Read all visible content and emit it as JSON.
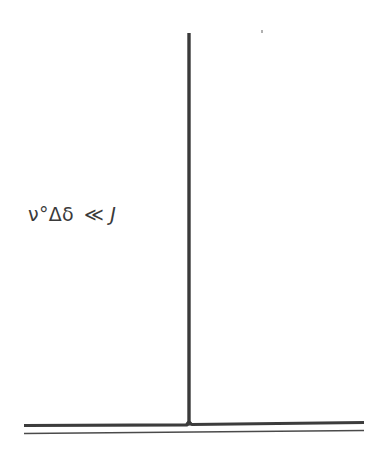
{
  "diagram": {
    "type": "nmr-spectrum",
    "annotation": {
      "left_part": "ν°Δδ",
      "relation": "≪",
      "right_part": "J"
    },
    "peaks": [
      {
        "x": 189,
        "top_y": 33,
        "description": "single sharp line"
      }
    ],
    "baseline": {
      "x_start": 24,
      "x_end": 364
    },
    "colors": {
      "ink": "#3a3a3a",
      "background": "#ffffff"
    }
  }
}
